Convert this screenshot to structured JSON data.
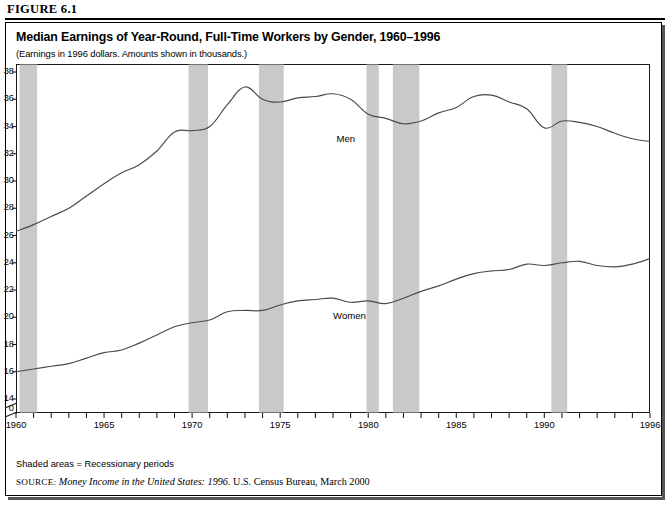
{
  "figure": {
    "number_label": "FIGURE 6.1"
  },
  "title": "Median Earnings of Year-Round, Full-Time Workers by Gender, 1960–1996",
  "subtitle": "(Earnings in 1996 dollars.  Amounts shown in thousands.)",
  "notes": {
    "shaded": "Shaded areas = Recessionary periods",
    "source_prefix": "SOURCE:",
    "source_italic": "Money Income in the United States: 1996.",
    "source_rest": " U.S. Census Bureau, March 2000"
  },
  "colors": {
    "line": "#4a4a4a",
    "recession_band": "#c9c9c9",
    "axis": "#1a1a1a",
    "text": "#000000",
    "background": "#ffffff"
  },
  "chart_data": {
    "type": "line",
    "title": "Median Earnings of Year-Round, Full-Time Workers by Gender, 1960–1996",
    "subtitle": "(Earnings in 1996 dollars.  Amounts shown in thousands.)",
    "xlabel": "",
    "ylabel": "",
    "grid": false,
    "legend_position": "inline-annotation",
    "xlim": [
      1960,
      1996
    ],
    "ylim": [
      14,
      38
    ],
    "y_axis_break": {
      "from": 0,
      "to": 14,
      "label_zero": "0"
    },
    "yticks": [
      14,
      16,
      18,
      20,
      22,
      24,
      26,
      28,
      30,
      32,
      34,
      36,
      38
    ],
    "xticks": [
      1960,
      1961,
      1962,
      1963,
      1964,
      1965,
      1966,
      1967,
      1968,
      1969,
      1970,
      1971,
      1972,
      1973,
      1974,
      1975,
      1976,
      1977,
      1978,
      1979,
      1980,
      1981,
      1982,
      1983,
      1984,
      1985,
      1986,
      1987,
      1988,
      1989,
      1990,
      1991,
      1992,
      1993,
      1994,
      1995,
      1996
    ],
    "xtick_labels": [
      "1960",
      "1965",
      "1970",
      "1975",
      "1980",
      "1985",
      "1990",
      "1996"
    ],
    "xtick_label_years": [
      1960,
      1965,
      1970,
      1975,
      1980,
      1985,
      1990,
      1996
    ],
    "x": [
      1960,
      1961,
      1962,
      1963,
      1964,
      1965,
      1966,
      1967,
      1968,
      1969,
      1970,
      1971,
      1972,
      1973,
      1974,
      1975,
      1976,
      1977,
      1978,
      1979,
      1980,
      1981,
      1982,
      1983,
      1984,
      1985,
      1986,
      1987,
      1988,
      1989,
      1990,
      1991,
      1992,
      1993,
      1994,
      1995,
      1996
    ],
    "series": [
      {
        "name": "Men",
        "label": "Men",
        "label_year": 1978.2,
        "label_value": 33.1,
        "values": [
          26.3,
          26.8,
          27.4,
          28.0,
          28.9,
          29.8,
          30.6,
          31.2,
          32.2,
          33.6,
          33.7,
          34.0,
          35.6,
          36.9,
          36.0,
          35.8,
          36.1,
          36.2,
          36.4,
          36.0,
          34.9,
          34.6,
          34.2,
          34.4,
          35.0,
          35.4,
          36.2,
          36.3,
          35.8,
          35.3,
          33.9,
          34.4,
          34.3,
          34.0,
          33.5,
          33.1,
          32.9
        ]
      },
      {
        "name": "Women",
        "label": "Women",
        "label_year": 1978.0,
        "label_value": 20.1,
        "values": [
          16.0,
          16.2,
          16.4,
          16.6,
          17.0,
          17.4,
          17.6,
          18.1,
          18.7,
          19.3,
          19.6,
          19.8,
          20.4,
          20.5,
          20.5,
          20.9,
          21.2,
          21.3,
          21.4,
          21.1,
          21.2,
          21.0,
          21.4,
          21.9,
          22.3,
          22.8,
          23.2,
          23.4,
          23.5,
          23.9,
          23.8,
          24.0,
          24.1,
          23.8,
          23.7,
          23.9,
          24.3
        ]
      }
    ],
    "recession_bands": [
      {
        "start": 1960.2,
        "end": 1961.2
      },
      {
        "start": 1969.8,
        "end": 1970.9
      },
      {
        "start": 1973.8,
        "end": 1975.2
      },
      {
        "start": 1979.9,
        "end": 1980.6
      },
      {
        "start": 1981.4,
        "end": 1982.9
      },
      {
        "start": 1990.4,
        "end": 1991.3
      }
    ],
    "annotations": [
      {
        "text": "Shaded areas = Recessionary periods"
      }
    ]
  }
}
